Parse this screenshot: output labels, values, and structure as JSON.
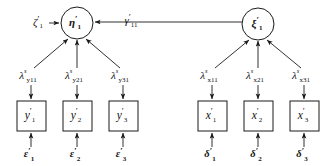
{
  "diagram": {
    "type": "sem-path-diagram",
    "background_color": "#ffffff",
    "stroke_color": "#1a1a1a",
    "latent_variables": [
      {
        "id": "eta1",
        "symbol": "η",
        "prime": "′",
        "subscript": "1",
        "shape": "circle",
        "cx": 77,
        "cy": 23,
        "r": 16
      },
      {
        "id": "xi1",
        "symbol": "ξ",
        "prime": "′",
        "subscript": "1",
        "shape": "circle",
        "cx": 258,
        "cy": 24,
        "r": 16
      }
    ],
    "disturbance": {
      "id": "zeta1",
      "symbol": "ζ",
      "prime": "′",
      "subscript": "1",
      "x": 40,
      "y": 23
    },
    "structural_coefficient": {
      "id": "gamma11",
      "symbol": "γ",
      "prime": "′",
      "subscript": "11",
      "x": 133,
      "y": 21
    },
    "y_loadings": [
      {
        "id": "lambda_y11",
        "symbol": "λ",
        "superscript": "s",
        "subscript": "y11",
        "x": 31,
        "y": 76
      },
      {
        "id": "lambda_y21",
        "symbol": "λ",
        "superscript": "s",
        "subscript": "y21",
        "x": 77,
        "y": 76
      },
      {
        "id": "lambda_y31",
        "symbol": "λ",
        "superscript": "s",
        "subscript": "y31",
        "x": 123,
        "y": 76
      }
    ],
    "x_loadings": [
      {
        "id": "lambda_x11",
        "symbol": "λ",
        "superscript": "s",
        "subscript": "x11",
        "x": 212,
        "y": 76
      },
      {
        "id": "lambda_x21",
        "symbol": "λ",
        "superscript": "s",
        "subscript": "x21",
        "x": 258,
        "y": 76
      },
      {
        "id": "lambda_x31",
        "symbol": "λ",
        "superscript": "s",
        "subscript": "x31",
        "x": 304,
        "y": 76
      }
    ],
    "y_indicators": [
      {
        "id": "y1",
        "symbol": "y",
        "prime": "′",
        "subscript": "1",
        "x": 17,
        "y": 101,
        "w": 29,
        "h": 30
      },
      {
        "id": "y2",
        "symbol": "y",
        "prime": "′",
        "subscript": "2",
        "x": 63,
        "y": 101,
        "w": 29,
        "h": 30
      },
      {
        "id": "y3",
        "symbol": "y",
        "prime": "′",
        "subscript": "3",
        "x": 109,
        "y": 101,
        "w": 29,
        "h": 30
      }
    ],
    "x_indicators": [
      {
        "id": "x1",
        "symbol": "x",
        "prime": "′",
        "subscript": "1",
        "x": 198,
        "y": 101,
        "w": 29,
        "h": 30
      },
      {
        "id": "x2",
        "symbol": "x",
        "prime": "′",
        "subscript": "2",
        "x": 244,
        "y": 101,
        "w": 29,
        "h": 30
      },
      {
        "id": "x3",
        "symbol": "x",
        "prime": "′",
        "subscript": "3",
        "x": 290,
        "y": 101,
        "w": 29,
        "h": 30
      }
    ],
    "y_errors": [
      {
        "id": "epsilon1",
        "symbol": "ε",
        "prime": "′",
        "subscript": "1",
        "x": 31,
        "y": 155
      },
      {
        "id": "epsilon2",
        "symbol": "ε",
        "prime": "′",
        "subscript": "2",
        "x": 77,
        "y": 155
      },
      {
        "id": "epsilon3",
        "symbol": "ε",
        "prime": "′",
        "subscript": "3",
        "x": 123,
        "y": 155
      }
    ],
    "x_errors": [
      {
        "id": "delta1",
        "symbol": "δ",
        "prime": "′",
        "subscript": "1",
        "x": 212,
        "y": 155
      },
      {
        "id": "delta2",
        "symbol": "δ",
        "prime": "′",
        "subscript": "2",
        "x": 258,
        "y": 155
      },
      {
        "id": "delta3",
        "symbol": "δ",
        "prime": "′",
        "subscript": "3",
        "x": 304,
        "y": 155
      }
    ]
  }
}
